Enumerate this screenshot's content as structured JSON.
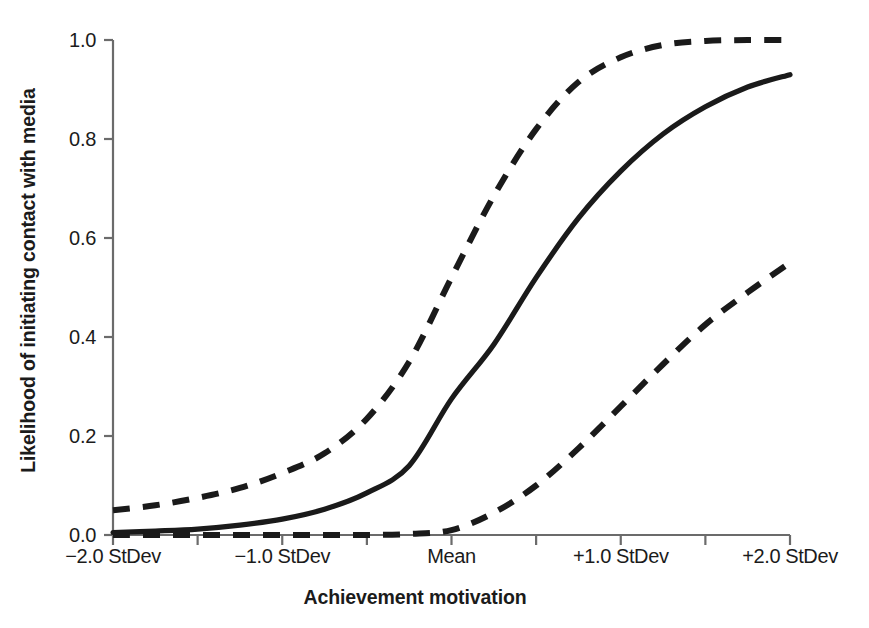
{
  "chart_data": {
    "type": "line",
    "title": "",
    "subtitle": "",
    "xlabel": "Achievement motivation",
    "ylabel": "Likelihood of initiating contact with media",
    "grid": false,
    "legend": "none",
    "xlim": [
      -2.0,
      2.0
    ],
    "ylim": [
      0.0,
      1.0
    ],
    "x_tick_labels": [
      "−2.0 StDev",
      "−1.0 StDev",
      "Mean",
      "+1.0 StDev",
      "+2.0 StDev"
    ],
    "x_tick_values": [
      -2.0,
      -1.0,
      0.0,
      1.0,
      2.0
    ],
    "x_minor_tick_values": [
      -1.5,
      -0.5,
      0.5,
      1.5
    ],
    "y_tick_labels": [
      "0.0",
      "0.2",
      "0.4",
      "0.6",
      "0.8",
      "1.0"
    ],
    "y_tick_values": [
      0.0,
      0.2,
      0.4,
      0.6,
      0.8,
      1.0
    ],
    "x": [
      -2.0,
      -1.75,
      -1.5,
      -1.25,
      -1.0,
      -0.75,
      -0.5,
      -0.25,
      0.0,
      0.25,
      0.5,
      0.75,
      1.0,
      1.25,
      1.5,
      1.75,
      2.0
    ],
    "series": [
      {
        "name": "Predicted likelihood (mean estimate)",
        "style": "solid",
        "color": "#1a1a1a",
        "values": [
          0.005,
          0.008,
          0.012,
          0.02,
          0.032,
          0.052,
          0.085,
          0.14,
          0.275,
          0.385,
          0.52,
          0.64,
          0.735,
          0.81,
          0.865,
          0.905,
          0.93
        ]
      },
      {
        "name": "Upper confidence bound",
        "style": "dashed",
        "color": "#1a1a1a",
        "values": [
          0.05,
          0.06,
          0.075,
          0.095,
          0.125,
          0.165,
          0.235,
          0.35,
          0.52,
          0.685,
          0.82,
          0.915,
          0.965,
          0.99,
          0.998,
          1.0,
          1.0
        ]
      },
      {
        "name": "Lower confidence bound",
        "style": "dashed",
        "color": "#1a1a1a",
        "values": [
          0.0,
          0.0,
          0.0,
          0.0,
          0.0,
          0.0,
          0.0,
          0.002,
          0.01,
          0.045,
          0.1,
          0.175,
          0.26,
          0.345,
          0.425,
          0.49,
          0.55
        ]
      }
    ]
  },
  "axis_style": {
    "axis_color": "#6b6b6b",
    "curve_color": "#1a1a1a",
    "text_color": "#1b1b1b"
  }
}
